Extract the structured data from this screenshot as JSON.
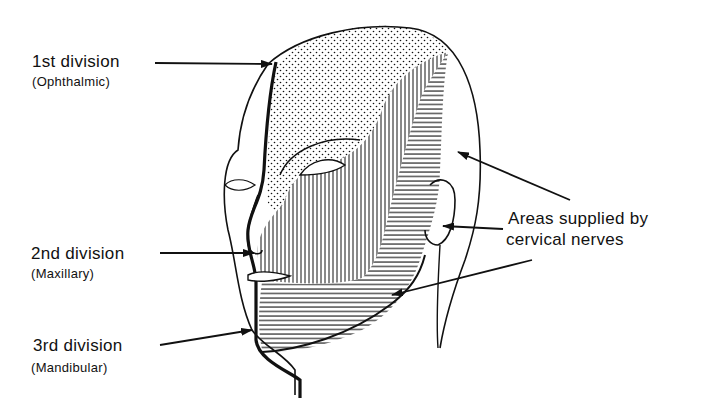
{
  "diagram": {
    "labels": [
      {
        "id": "ophthalmic",
        "main": "1st  division",
        "sub": "(Ophthalmic)",
        "pattern": "stipple"
      },
      {
        "id": "maxillary",
        "main": "2nd  division",
        "sub": "(Maxillary)",
        "pattern": "vertical-hatch"
      },
      {
        "id": "mandibular",
        "main": "3rd  division",
        "sub": "(Mandibular)",
        "pattern": "horizontal-hatch"
      }
    ],
    "cervical": {
      "line1": "Areas supplied by",
      "line2": "cervical nerves"
    },
    "colors": {
      "ink": "#111111",
      "background": "#ffffff"
    }
  }
}
